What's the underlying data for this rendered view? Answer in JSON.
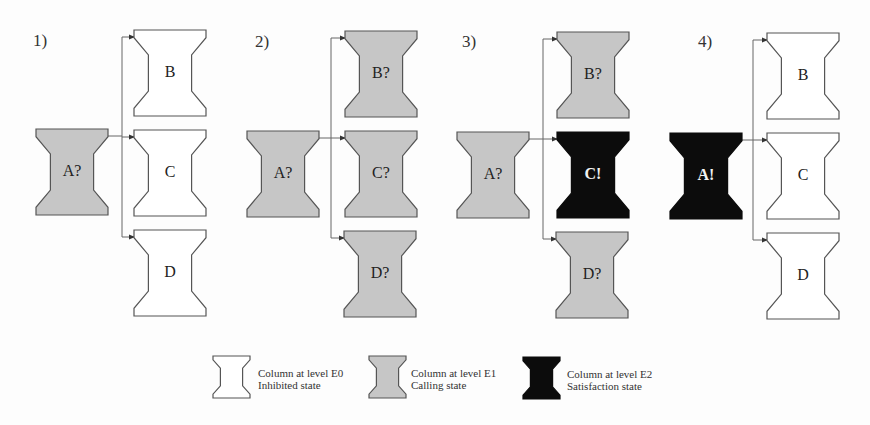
{
  "colors": {
    "e0_fill": "#ffffff",
    "e1_fill": "#c6c6c6",
    "e2_fill": "#0c0c0c",
    "stroke": "#555555",
    "wire": "#666666"
  },
  "panels": [
    {
      "label": "1)",
      "label_pos": [
        33,
        32
      ],
      "source": {
        "text": "A?",
        "state": "e1",
        "x": 36,
        "y": 129
      },
      "trunk_x": 122,
      "targets": [
        {
          "text": "B",
          "state": "e0",
          "x": 134,
          "y": 30
        },
        {
          "text": "C",
          "state": "e0",
          "x": 134,
          "y": 130
        },
        {
          "text": "D",
          "state": "e0",
          "x": 134,
          "y": 230
        }
      ]
    },
    {
      "label": "2)",
      "label_pos": [
        255,
        33
      ],
      "source": {
        "text": "A?",
        "state": "e1",
        "x": 247,
        "y": 131
      },
      "trunk_x": 331,
      "targets": [
        {
          "text": "B?",
          "state": "e1",
          "x": 345,
          "y": 31
        },
        {
          "text": "C?",
          "state": "e1",
          "x": 345,
          "y": 131
        },
        {
          "text": "D?",
          "state": "e1",
          "x": 344,
          "y": 231
        }
      ]
    },
    {
      "label": "3)",
      "label_pos": [
        462,
        33
      ],
      "source": {
        "text": "A?",
        "state": "e1",
        "x": 457,
        "y": 132
      },
      "trunk_x": 543,
      "targets": [
        {
          "text": "B?",
          "state": "e1",
          "x": 557,
          "y": 32
        },
        {
          "text": "C!",
          "state": "e2",
          "x": 557,
          "y": 132
        },
        {
          "text": "D?",
          "state": "e1",
          "x": 556,
          "y": 232
        }
      ]
    },
    {
      "label": "4)",
      "label_pos": [
        698,
        33
      ],
      "source": {
        "text": "A!",
        "state": "e2",
        "x": 670,
        "y": 133
      },
      "trunk_x": 753,
      "targets": [
        {
          "text": "B",
          "state": "e0",
          "x": 767,
          "y": 33
        },
        {
          "text": "C",
          "state": "e0",
          "x": 767,
          "y": 133
        },
        {
          "text": "D",
          "state": "e0",
          "x": 767,
          "y": 233
        }
      ]
    }
  ],
  "legend": [
    {
      "state": "e0",
      "x": 213,
      "y": 356,
      "line1": "Column at level E0",
      "line2": "Inhibited state"
    },
    {
      "state": "e1",
      "x": 369,
      "y": 356,
      "line1": "Column at level E1",
      "line2": "Calling state"
    },
    {
      "state": "e2",
      "x": 523,
      "y": 357,
      "line1": "Column at level E2",
      "line2": "Satisfaction state"
    }
  ]
}
